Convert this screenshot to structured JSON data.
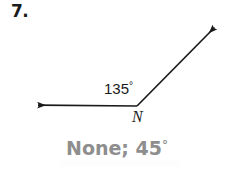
{
  "problem": {
    "number_label": "7."
  },
  "figure": {
    "type": "angle-diagram",
    "vertex_label": "N",
    "angle_measure_label": "135",
    "degree_symbol": "°",
    "stroke_color": "#1a1a1a",
    "vertex_point": {
      "x": 137,
      "y": 106
    },
    "rays": [
      {
        "name": "left-horizontal-ray",
        "from": {
          "x": 137,
          "y": 106
        },
        "to": {
          "x": 31,
          "y": 105
        },
        "arrowhead": "end"
      },
      {
        "name": "upper-right-diagonal-ray",
        "from": {
          "x": 137,
          "y": 106
        },
        "to": {
          "x": 221,
          "y": 21
        },
        "arrowhead": "end"
      }
    ]
  },
  "answer": {
    "text": "None; 45",
    "degree_symbol": "°",
    "color": "#8e8e8e"
  },
  "page": {
    "background_color": "#ffffff"
  }
}
